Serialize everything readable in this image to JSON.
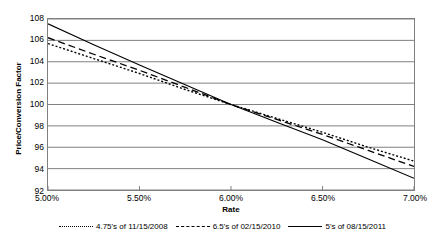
{
  "chart_data": {
    "type": "line",
    "title": "",
    "xlabel": "Rate",
    "ylabel": "Price/Conversion Factor",
    "xlim": [
      5.0,
      7.0
    ],
    "ylim": [
      92,
      108
    ],
    "grid": true,
    "legend_position": "bottom",
    "x_tick_labels": [
      "5.00%",
      "5.50%",
      "6.00%",
      "6.50%",
      "7.00%"
    ],
    "x_tick_values": [
      5.0,
      5.5,
      6.0,
      6.5,
      7.0
    ],
    "y_tick_labels": [
      "92",
      "94",
      "96",
      "98",
      "100",
      "102",
      "104",
      "106",
      "108"
    ],
    "y_tick_values": [
      92,
      94,
      96,
      98,
      100,
      102,
      104,
      106,
      108
    ],
    "x": [
      5.0,
      5.25,
      5.5,
      5.75,
      6.0,
      6.25,
      6.5,
      6.75,
      7.0
    ],
    "series": [
      {
        "name": "4.75's of 11/15/2008",
        "style": "dotted",
        "color": "#000000",
        "values": [
          105.7,
          104.3,
          102.9,
          101.4,
          100.0,
          98.7,
          97.4,
          96.0,
          94.7
        ]
      },
      {
        "name": "6.5's of 02/15/2010",
        "style": "dashed",
        "color": "#000000",
        "values": [
          106.25,
          104.7,
          103.2,
          101.6,
          100.0,
          98.6,
          97.2,
          95.7,
          94.2
        ]
      },
      {
        "name": "5's of 08/15/2011",
        "style": "solid",
        "color": "#000000",
        "values": [
          107.55,
          105.6,
          103.7,
          101.85,
          100.0,
          98.35,
          96.7,
          94.9,
          93.1
        ]
      }
    ]
  },
  "axes": {
    "y_title": "Price/Conversion Factor",
    "x_title": "Rate"
  },
  "legend": {
    "items": [
      {
        "label": "4.75's of 11/15/2008",
        "style": "dotted"
      },
      {
        "label": "6.5's of 02/15/2010",
        "style": "dashed"
      },
      {
        "label": "5's of 08/15/2011",
        "style": "solid"
      }
    ]
  },
  "colors": {
    "line": "#000000",
    "grid": "#808080",
    "axis": "#808080",
    "background": "#ffffff"
  }
}
